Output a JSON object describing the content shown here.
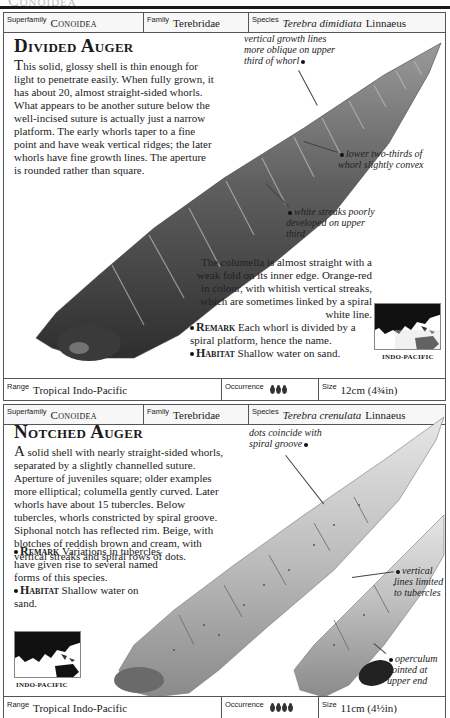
{
  "page_header": {
    "ghost_title": "Conoidea"
  },
  "entries": [
    {
      "taxonomy": {
        "superfamily_label": "Superfamily",
        "superfamily": "Conoidea",
        "family_label": "Family",
        "family": "Terebridae",
        "species_label": "Species",
        "species_name": "Terebra dimidiata",
        "species_author": "Linnaeus"
      },
      "title": "Divided Auger",
      "description": "his solid, glossy shell is thin enough for light to penetrate easily. When fully grown, it has about 20, almost straight-sided whorls. What appears to be another suture below the well-incised suture is actually just a narrow platform. The early whorls taper to a fine point and have weak vertical ridges; the later whorls have fine growth lines. The aperture is rounded rather than square.",
      "description_dropcap": "T",
      "description2": "The columella is almost straight with a weak fold on its inner edge. Orange-red in colour, with whitish vertical streaks, which are sometimes linked by a spiral white line.",
      "remark_label": "Remark",
      "remark": "Each whorl is divided by a spiral platform, hence the name.",
      "habitat_label": "Habitat",
      "habitat": "Shallow water on sand.",
      "annotations": [
        "vertical growth lines more oblique on upper third of whorl",
        "lower two-thirds of whorl slightly convex",
        "white streaks poorly developed on upper third"
      ],
      "map_caption": "INDO-PACIFIC",
      "footer": {
        "range_label": "Range",
        "range": "Tropical Indo-Pacific",
        "occurrence_label": "Occurrence",
        "occurrence_level": 3,
        "size_label": "Size",
        "size": "12cm (4¾in)"
      }
    },
    {
      "taxonomy": {
        "superfamily_label": "Superfamily",
        "superfamily": "Conoidea",
        "family_label": "Family",
        "family": "Terebridae",
        "species_label": "Species",
        "species_name": "Terebra crenulata",
        "species_author": "Linnaeus"
      },
      "title": "Notched Auger",
      "description_dropcap": "A",
      "description": " solid shell with nearly straight-sided whorls, separated by a slightly channelled suture. Aperture of juveniles square; older examples more elliptical; columella gently curved. Later whorls have about 15 tubercles. Below tubercles, whorls constricted by spiral groove. Siphonal notch has reflected rim. Beige, with blotches of reddish brown and cream, with vertical streaks and spiral rows of dots.",
      "remark_label": "Remark",
      "remark": "Variations in tubercles have given rise to several named forms of this species.",
      "habitat_label": "Habitat",
      "habitat": "Shallow water on sand.",
      "annotations": [
        "dots coincide with spiral groove",
        "vertical lines limited to tubercles",
        "operculum pointed at upper end"
      ],
      "map_caption": "INDO-PACIFIC",
      "footer": {
        "range_label": "Range",
        "range": "Tropical Indo-Pacific",
        "occurrence_label": "Occurrence",
        "occurrence_level": 4,
        "size_label": "Size",
        "size": "11cm (4½in)"
      }
    }
  ]
}
